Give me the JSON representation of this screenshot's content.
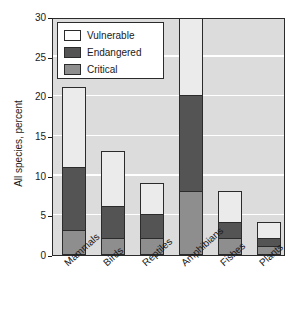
{
  "chart_data": {
    "type": "bar",
    "subtype": "stacked-vertical",
    "title": "",
    "xlabel": "",
    "ylabel": "All species, percent",
    "ylim": [
      0,
      30
    ],
    "yticks": [
      0,
      5,
      10,
      15,
      20,
      25,
      30
    ],
    "ytick_labels": [
      "0",
      "5",
      "10",
      "15",
      "20",
      "25",
      "30"
    ],
    "grid": "horizontal",
    "legend_position": "top-left",
    "categories": [
      "Mammals",
      "Birds",
      "Reptiles",
      "Amphibians",
      "Fishes",
      "Plants"
    ],
    "series": [
      {
        "name": "Critical",
        "color": "#8e8e8e",
        "values": [
          3,
          2,
          2,
          8,
          2,
          1
        ]
      },
      {
        "name": "Endangered",
        "color": "#545454",
        "values": [
          8,
          4,
          3,
          12,
          2,
          1
        ]
      },
      {
        "name": "Vulnerable",
        "color": "#ebebeb",
        "values": [
          10,
          7,
          4,
          10,
          4,
          2
        ]
      }
    ],
    "cumulative_totals": [
      21,
      13,
      9,
      30,
      8,
      4
    ],
    "clipped_categories": [
      "Amphibians"
    ]
  },
  "legend": {
    "items": [
      {
        "label": "Vulnerable",
        "swatch": "vulnerable"
      },
      {
        "label": "Endangered",
        "swatch": "endangered"
      },
      {
        "label": "Critical",
        "swatch": "critical"
      }
    ]
  },
  "colors": {
    "plot_background": "#dcdcdc",
    "gridline": "#ffffff",
    "axis": "#2b2b2b",
    "text": "#1a1a1a",
    "vulnerable": "#ebebeb",
    "endangered": "#545454",
    "critical": "#8e8e8e"
  }
}
